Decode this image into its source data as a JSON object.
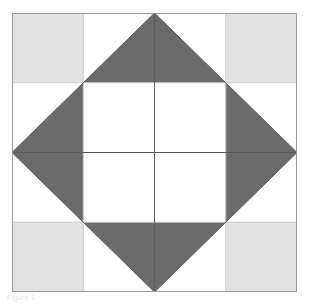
{
  "figure": {
    "caption": "Figure 1",
    "background_color": "#ffffff"
  },
  "colors": {
    "background": "#ffffff",
    "light_gray": "#e2e2e2",
    "dark_gray": "#6b6b6b",
    "frame_border": "#9a9a9a",
    "grid_line": "#c9c9c9",
    "seam_line": "#5a5a5a",
    "caption_text": "#e0e0e0"
  },
  "block": {
    "name": "square-in-a-square quilt block",
    "frame": {
      "x": 12,
      "y": 13,
      "width": 285,
      "height": 279,
      "border_width": 1
    },
    "grid": {
      "columns": 4,
      "rows": 4,
      "cell_width": 71.25,
      "cell_height": 69.75,
      "line_width": 1,
      "show_lines": true
    },
    "corner_squares": [
      {
        "name": "top-left-corner-square",
        "col": 0,
        "row": 0,
        "fill": "#e2e2e2"
      },
      {
        "name": "top-right-corner-square",
        "col": 3,
        "row": 0,
        "fill": "#e2e2e2"
      },
      {
        "name": "bottom-left-corner-square",
        "col": 0,
        "row": 3,
        "fill": "#e2e2e2"
      },
      {
        "name": "bottom-right-corner-square",
        "col": 3,
        "row": 3,
        "fill": "#e2e2e2"
      }
    ],
    "diamond": {
      "name": "center-diamond",
      "fill": "#6b6b6b",
      "vertices": [
        {
          "label": "top",
          "x": 142.5,
          "y": 0
        },
        {
          "label": "right",
          "x": 285,
          "y": 139.5
        },
        {
          "label": "bottom",
          "x": 142.5,
          "y": 279
        },
        {
          "label": "left",
          "x": 0,
          "y": 139.5
        }
      ]
    },
    "inner_square": {
      "name": "inner-white-square",
      "fill": "#ffffff",
      "x": 71.25,
      "y": 69.75,
      "width": 142.5,
      "height": 139.5
    },
    "seam_lines": [
      {
        "name": "diamond-edge-top-left",
        "x1": 0,
        "y1": 139.5,
        "x2": 142.5,
        "y2": 0
      },
      {
        "name": "diamond-edge-top-right",
        "x1": 142.5,
        "y1": 0,
        "x2": 285,
        "y2": 139.5
      },
      {
        "name": "diamond-edge-bottom-right",
        "x1": 285,
        "y1": 139.5,
        "x2": 142.5,
        "y2": 279
      },
      {
        "name": "diamond-edge-bottom-left",
        "x1": 142.5,
        "y1": 279,
        "x2": 0,
        "y2": 139.5
      },
      {
        "name": "center-vertical-seam",
        "x1": 142.5,
        "y1": 0,
        "x2": 142.5,
        "y2": 279
      },
      {
        "name": "center-horizontal-seam",
        "x1": 0,
        "y1": 139.5,
        "x2": 285,
        "y2": 139.5
      }
    ]
  }
}
